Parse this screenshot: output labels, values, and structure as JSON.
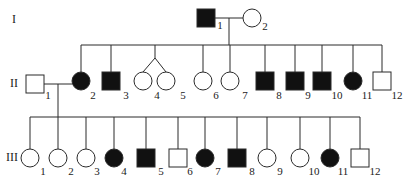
{
  "colors": {
    "line": "#2a2a2a",
    "affected": "#111111",
    "unaffected": "#ffffff"
  },
  "generations": [
    {
      "label": "I",
      "x": 12,
      "y": 12
    },
    {
      "label": "II",
      "x": 10,
      "y": 76
    },
    {
      "label": "III",
      "x": 6,
      "y": 150
    }
  ],
  "individuals": [
    {
      "id": "I-1",
      "gen": "I",
      "num": "1",
      "sex": "male",
      "affected": true,
      "cx": 206,
      "cy": 18,
      "lx": 220,
      "ly": 25
    },
    {
      "id": "I-2",
      "gen": "I",
      "num": "2",
      "sex": "female",
      "affected": false,
      "cx": 252,
      "cy": 18,
      "lx": 265,
      "ly": 26
    },
    {
      "id": "II-1",
      "gen": "II",
      "num": "1",
      "sex": "male",
      "affected": false,
      "cx": 35,
      "cy": 84,
      "lx": 48,
      "ly": 95
    },
    {
      "id": "II-2",
      "gen": "II",
      "num": "2",
      "sex": "female",
      "affected": true,
      "cx": 81,
      "cy": 81,
      "lx": 93,
      "ly": 95
    },
    {
      "id": "II-3",
      "gen": "II",
      "num": "3",
      "sex": "male",
      "affected": true,
      "cx": 111,
      "cy": 81,
      "lx": 126,
      "ly": 95
    },
    {
      "id": "II-4a",
      "gen": "II",
      "num": "4",
      "sex": "female",
      "affected": false,
      "cx": 143,
      "cy": 81,
      "lx": 157,
      "ly": 95
    },
    {
      "id": "II-5",
      "gen": "II",
      "num": "5",
      "sex": "female",
      "affected": false,
      "cx": 166,
      "cy": 81,
      "lx": 183,
      "ly": 95
    },
    {
      "id": "II-6",
      "gen": "II",
      "num": "6",
      "sex": "female",
      "affected": false,
      "cx": 203,
      "cy": 81,
      "lx": 216,
      "ly": 95
    },
    {
      "id": "II-7",
      "gen": "II",
      "num": "7",
      "sex": "female",
      "affected": false,
      "cx": 230,
      "cy": 81,
      "lx": 245,
      "ly": 95
    },
    {
      "id": "II-8",
      "gen": "II",
      "num": "8",
      "sex": "male",
      "affected": true,
      "cx": 265,
      "cy": 81,
      "lx": 279,
      "ly": 95
    },
    {
      "id": "II-9",
      "gen": "II",
      "num": "9",
      "sex": "male",
      "affected": true,
      "cx": 295,
      "cy": 81,
      "lx": 308,
      "ly": 95
    },
    {
      "id": "II-10",
      "gen": "II",
      "num": "10",
      "sex": "male",
      "affected": true,
      "cx": 322,
      "cy": 81,
      "lx": 337,
      "ly": 95
    },
    {
      "id": "II-11",
      "gen": "II",
      "num": "11",
      "sex": "female",
      "affected": true,
      "cx": 353,
      "cy": 81,
      "lx": 367,
      "ly": 95
    },
    {
      "id": "II-12",
      "gen": "II",
      "num": "12",
      "sex": "male",
      "affected": false,
      "cx": 382,
      "cy": 81,
      "lx": 397,
      "ly": 95
    },
    {
      "id": "III-1",
      "gen": "III",
      "num": "1",
      "sex": "female",
      "affected": false,
      "cx": 30,
      "cy": 158,
      "lx": 43,
      "ly": 171
    },
    {
      "id": "III-2",
      "gen": "III",
      "num": "2",
      "sex": "female",
      "affected": false,
      "cx": 58,
      "cy": 158,
      "lx": 71,
      "ly": 171
    },
    {
      "id": "III-3",
      "gen": "III",
      "num": "3",
      "sex": "female",
      "affected": false,
      "cx": 86,
      "cy": 158,
      "lx": 97,
      "ly": 171
    },
    {
      "id": "III-4",
      "gen": "III",
      "num": "4",
      "sex": "female",
      "affected": true,
      "cx": 114,
      "cy": 158,
      "lx": 124,
      "ly": 171
    },
    {
      "id": "III-5",
      "gen": "III",
      "num": "5",
      "sex": "male",
      "affected": true,
      "cx": 146,
      "cy": 158,
      "lx": 161,
      "ly": 171
    },
    {
      "id": "III-6",
      "gen": "III",
      "num": "6",
      "sex": "male",
      "affected": false,
      "cx": 178,
      "cy": 158,
      "lx": 190,
      "ly": 171
    },
    {
      "id": "III-7",
      "gen": "III",
      "num": "7",
      "sex": "female",
      "affected": true,
      "cx": 205,
      "cy": 158,
      "lx": 218,
      "ly": 171
    },
    {
      "id": "III-8",
      "gen": "III",
      "num": "8",
      "sex": "male",
      "affected": true,
      "cx": 237,
      "cy": 158,
      "lx": 252,
      "ly": 171
    },
    {
      "id": "III-9",
      "gen": "III",
      "num": "9",
      "sex": "female",
      "affected": false,
      "cx": 267,
      "cy": 158,
      "lx": 280,
      "ly": 171
    },
    {
      "id": "III-10",
      "gen": "III",
      "num": "10",
      "sex": "female",
      "affected": false,
      "cx": 300,
      "cy": 158,
      "lx": 314,
      "ly": 171
    },
    {
      "id": "III-11",
      "gen": "III",
      "num": "11",
      "sex": "female",
      "affected": true,
      "cx": 330,
      "cy": 158,
      "lx": 343,
      "ly": 171
    },
    {
      "id": "III-12",
      "gen": "III",
      "num": "12",
      "sex": "male",
      "affected": false,
      "cx": 360,
      "cy": 158,
      "lx": 375,
      "ly": 171
    }
  ],
  "twins": {
    "apex": [
      155,
      58
    ],
    "children": [
      "II-4a",
      "II-5"
    ],
    "label": "4",
    "label2": "5"
  },
  "lines": [
    {
      "type": "mating-I",
      "x1": 215,
      "y1": 18,
      "x2": 243,
      "y2": 18
    },
    {
      "type": "descent-I",
      "x1": 229,
      "y1": 18,
      "x2": 229,
      "y2": 45
    },
    {
      "type": "sibship-II",
      "x1": 81,
      "y1": 45,
      "x2": 382,
      "y2": 45
    },
    {
      "type": "mating-II",
      "x1": 44,
      "y1": 84,
      "x2": 72,
      "y2": 84
    },
    {
      "type": "descent-II",
      "x1": 58,
      "y1": 84,
      "x2": 58,
      "y2": 117
    },
    {
      "type": "sibship-III",
      "x1": 30,
      "y1": 117,
      "x2": 360,
      "y2": 117
    }
  ]
}
